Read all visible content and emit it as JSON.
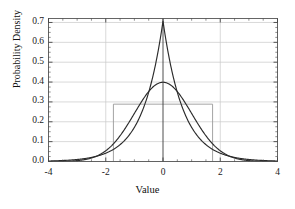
{
  "chart_data": {
    "type": "line",
    "title": "",
    "xlabel": "Value",
    "ylabel": "Probability Density",
    "xlim": [
      -4,
      4
    ],
    "ylim": [
      0,
      0.72
    ],
    "grid": true,
    "legend": "none",
    "xticks": [
      -4,
      -2,
      0,
      2,
      4
    ],
    "xtick_labels": [
      "-4",
      "-2",
      "0",
      "2",
      "4"
    ],
    "yticks": [
      0.0,
      0.1,
      0.2,
      0.3,
      0.4,
      0.5,
      0.6,
      0.7
    ],
    "ytick_labels": [
      "0.0",
      "0.1",
      "0.2",
      "0.3",
      "0.4",
      "0.5",
      "0.6",
      "0.7"
    ],
    "x_minor_tick_step": 0.5,
    "y_minor_tick_step": 0.025,
    "series": [
      {
        "name": "Laplace distribution (mean 0, variance 1)",
        "style": "line",
        "color": "#2b2b2b",
        "peak_x": 0,
        "peak_y": 0.707,
        "x": [
          -4,
          -3.5,
          -3,
          -2.5,
          -2,
          -1.75,
          -1.5,
          -1.25,
          -1,
          -0.75,
          -0.5,
          -0.25,
          -0.1,
          0,
          0.1,
          0.25,
          0.5,
          0.75,
          1,
          1.25,
          1.5,
          1.75,
          2,
          2.5,
          3,
          3.5,
          4
        ],
        "values": [
          0.0017,
          0.0042,
          0.0102,
          0.0247,
          0.0599,
          0.0933,
          0.1453,
          0.2263,
          0.3524,
          0.5489,
          0.3489,
          0.4962,
          0.6134,
          0.7071,
          0.6134,
          0.4962,
          0.3489,
          0.2453,
          0.1724,
          0.1212,
          0.0852,
          0.0599,
          0.0421,
          0.0208,
          0.0103,
          0.0051,
          0.0025
        ]
      },
      {
        "name": "Normal distribution (mean 0, variance 1)",
        "style": "line",
        "color": "#2b2b2b",
        "peak_x": 0,
        "peak_y": 0.399,
        "x": [
          -4,
          -3.5,
          -3,
          -2.5,
          -2,
          -1.5,
          -1,
          -0.5,
          0,
          0.5,
          1,
          1.5,
          2,
          2.5,
          3,
          3.5,
          4
        ],
        "values": [
          0.0001,
          0.0009,
          0.0044,
          0.0175,
          0.054,
          0.1295,
          0.242,
          0.3521,
          0.3989,
          0.3521,
          0.242,
          0.1295,
          0.054,
          0.0175,
          0.0044,
          0.0009,
          0.0001
        ]
      },
      {
        "name": "Uniform distribution (mean 0, variance 1)",
        "style": "rectangle",
        "color": "#9a9a9a",
        "x_start": -1.732,
        "x_end": 1.732,
        "height": 0.2887
      }
    ]
  }
}
